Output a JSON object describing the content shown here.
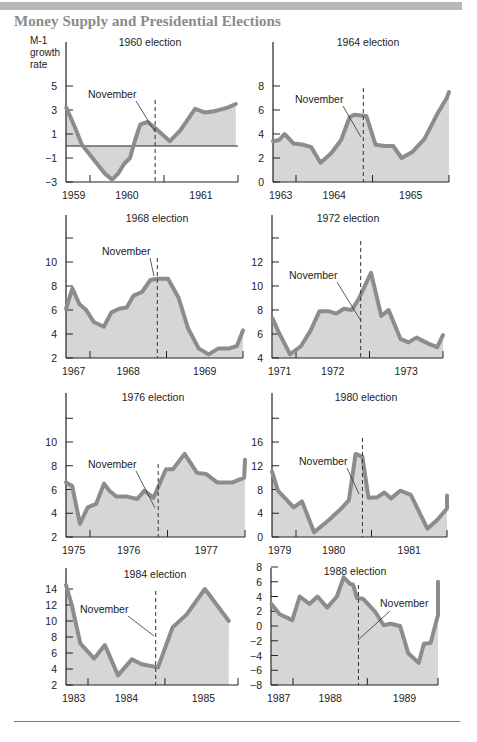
{
  "title": "Money Supply and Presidential Elections",
  "y_axis_label": [
    "M-1",
    "growth",
    "rate"
  ],
  "marker_label": "November",
  "colors": {
    "line": "#8c8c8c",
    "fill": "#d6d6d6",
    "axis": "#222222",
    "title": "#8a8a8a",
    "band": "#b9b9b9"
  },
  "chart_data": [
    {
      "type": "area",
      "title": "1960 election",
      "ylabel": "M-1 growth rate",
      "yticks": [
        5,
        3,
        1,
        -1,
        -3
      ],
      "ylim": [
        -3,
        5
      ],
      "zero_line": true,
      "years": [
        "1959",
        "1960",
        "1961"
      ],
      "november": 1960.88,
      "points": [
        [
          1959.68,
          3.2
        ],
        [
          1959.8,
          1.5
        ],
        [
          1959.89,
          0.1
        ],
        [
          1960.07,
          -1.3
        ],
        [
          1960.2,
          -2.3
        ],
        [
          1960.3,
          -2.8
        ],
        [
          1960.38,
          -2.3
        ],
        [
          1960.46,
          -1.5
        ],
        [
          1960.54,
          -1.0
        ],
        [
          1960.61,
          0.5
        ],
        [
          1960.68,
          1.8
        ],
        [
          1960.78,
          2.0
        ],
        [
          1960.88,
          1.5
        ],
        [
          1961.08,
          0.4
        ],
        [
          1961.22,
          1.3
        ],
        [
          1961.42,
          3.1
        ],
        [
          1961.55,
          2.8
        ],
        [
          1961.68,
          2.9
        ],
        [
          1961.86,
          3.2
        ],
        [
          1961.97,
          3.5
        ]
      ]
    },
    {
      "type": "area",
      "title": "1964 election",
      "yticks": [
        8,
        6,
        4,
        2,
        0
      ],
      "ylim": [
        0,
        8
      ],
      "years": [
        "1963",
        "1964",
        "1965"
      ],
      "november": 1964.88,
      "points": [
        [
          1963.68,
          3.4
        ],
        [
          1963.78,
          3.5
        ],
        [
          1963.85,
          4.0
        ],
        [
          1963.97,
          3.2
        ],
        [
          1964.1,
          3.1
        ],
        [
          1964.2,
          2.9
        ],
        [
          1964.32,
          1.6
        ],
        [
          1964.46,
          2.4
        ],
        [
          1964.59,
          3.5
        ],
        [
          1964.7,
          5.4
        ],
        [
          1964.76,
          5.6
        ],
        [
          1964.92,
          5.5
        ],
        [
          1965.04,
          3.1
        ],
        [
          1965.16,
          3.0
        ],
        [
          1965.27,
          3.0
        ],
        [
          1965.38,
          2.0
        ],
        [
          1965.52,
          2.5
        ],
        [
          1965.68,
          3.6
        ],
        [
          1965.84,
          5.6
        ],
        [
          1965.97,
          7.0
        ],
        [
          1966.05,
          7.5
        ]
      ]
    },
    {
      "type": "area",
      "title": "1968 election",
      "yticks": [
        10,
        8,
        6,
        4,
        2
      ],
      "ylim": [
        2,
        14
      ],
      "years": [
        "1967",
        "1968",
        "1969"
      ],
      "november": 1968.88,
      "points": [
        [
          1967.68,
          6.1
        ],
        [
          1967.77,
          7.8
        ],
        [
          1967.86,
          6.5
        ],
        [
          1967.95,
          6.0
        ],
        [
          1968.05,
          5.0
        ],
        [
          1968.18,
          4.6
        ],
        [
          1968.28,
          5.8
        ],
        [
          1968.38,
          6.1
        ],
        [
          1968.48,
          6.2
        ],
        [
          1968.57,
          7.2
        ],
        [
          1968.68,
          7.5
        ],
        [
          1968.79,
          8.5
        ],
        [
          1968.88,
          8.6
        ],
        [
          1969.02,
          8.6
        ],
        [
          1969.16,
          7.0
        ],
        [
          1969.28,
          4.5
        ],
        [
          1969.42,
          2.8
        ],
        [
          1969.55,
          2.3
        ],
        [
          1969.68,
          2.8
        ],
        [
          1969.82,
          2.8
        ],
        [
          1969.92,
          3.0
        ],
        [
          1970.02,
          4.3
        ]
      ]
    },
    {
      "type": "area",
      "title": "1972 election",
      "yticks": [
        12,
        10,
        8,
        6,
        4
      ],
      "ylim": [
        4,
        16
      ],
      "years": [
        "1971",
        "1972",
        "1973"
      ],
      "november": 1972.88,
      "points": [
        [
          1971.68,
          7.3
        ],
        [
          1971.76,
          6.2
        ],
        [
          1971.92,
          4.3
        ],
        [
          1972.07,
          5.0
        ],
        [
          1972.2,
          6.3
        ],
        [
          1972.32,
          7.9
        ],
        [
          1972.44,
          7.9
        ],
        [
          1972.55,
          7.7
        ],
        [
          1972.65,
          8.1
        ],
        [
          1972.76,
          8.0
        ],
        [
          1972.86,
          9.0
        ],
        [
          1973.02,
          11.1
        ],
        [
          1973.16,
          7.5
        ],
        [
          1973.26,
          8.0
        ],
        [
          1973.42,
          5.6
        ],
        [
          1973.53,
          5.3
        ],
        [
          1973.64,
          5.7
        ],
        [
          1973.8,
          5.2
        ],
        [
          1973.92,
          4.9
        ],
        [
          1974.0,
          5.9
        ]
      ]
    },
    {
      "type": "area",
      "title": "1976 election",
      "yticks": [
        10,
        8,
        6,
        4,
        2
      ],
      "ylim": [
        2,
        14
      ],
      "years": [
        "1975",
        "1976",
        "1977"
      ],
      "november": 1976.88,
      "points": [
        [
          1975.68,
          6.6
        ],
        [
          1975.77,
          6.3
        ],
        [
          1975.87,
          3.1
        ],
        [
          1975.97,
          4.5
        ],
        [
          1976.08,
          4.8
        ],
        [
          1976.18,
          6.5
        ],
        [
          1976.25,
          5.9
        ],
        [
          1976.34,
          5.4
        ],
        [
          1976.48,
          5.4
        ],
        [
          1976.61,
          5.2
        ],
        [
          1976.7,
          5.9
        ],
        [
          1976.82,
          5.3
        ],
        [
          1976.98,
          7.7
        ],
        [
          1977.07,
          7.7
        ],
        [
          1977.22,
          9.0
        ],
        [
          1977.38,
          7.4
        ],
        [
          1977.5,
          7.3
        ],
        [
          1977.64,
          6.6
        ],
        [
          1977.84,
          6.6
        ],
        [
          1977.99,
          7.0
        ],
        [
          1978.15,
          8.5
        ]
      ]
    },
    {
      "type": "area",
      "title": "1980 election",
      "yticks": [
        16,
        12,
        8,
        4,
        0
      ],
      "ylim": [
        0,
        24
      ],
      "years": [
        "1979",
        "1980",
        "1981"
      ],
      "november": 1980.88,
      "points": [
        [
          1979.68,
          11.0
        ],
        [
          1979.76,
          7.8
        ],
        [
          1979.97,
          5.0
        ],
        [
          1980.08,
          6.0
        ],
        [
          1980.24,
          0.8
        ],
        [
          1980.44,
          2.9
        ],
        [
          1980.6,
          4.8
        ],
        [
          1980.7,
          6.2
        ],
        [
          1980.79,
          14.0
        ],
        [
          1980.88,
          13.5
        ],
        [
          1980.96,
          6.6
        ],
        [
          1981.08,
          6.7
        ],
        [
          1981.17,
          7.5
        ],
        [
          1981.26,
          6.5
        ],
        [
          1981.38,
          7.8
        ],
        [
          1981.52,
          7.1
        ],
        [
          1981.74,
          1.4
        ],
        [
          1981.88,
          3.0
        ],
        [
          1982.06,
          4.8
        ],
        [
          1982.15,
          7.0
        ]
      ]
    },
    {
      "type": "area",
      "title": "1984 election",
      "yticks": [
        14,
        12,
        10,
        8,
        6,
        4,
        2
      ],
      "ylim": [
        2,
        16
      ],
      "years": [
        "1983",
        "1984",
        "1985"
      ],
      "november": 1984.88,
      "points": [
        [
          1983.71,
          14.5
        ],
        [
          1983.79,
          12.0
        ],
        [
          1983.9,
          7.2
        ],
        [
          1984.08,
          5.3
        ],
        [
          1984.22,
          7.0
        ],
        [
          1984.39,
          3.2
        ],
        [
          1984.57,
          5.2
        ],
        [
          1984.7,
          4.6
        ],
        [
          1984.91,
          4.2
        ],
        [
          1985.1,
          9.2
        ],
        [
          1985.28,
          10.8
        ],
        [
          1985.52,
          14.0
        ],
        [
          1985.83,
          10.0
        ]
      ]
    },
    {
      "type": "area",
      "title": "1988 election",
      "yticks": [
        8,
        6,
        4,
        2,
        0,
        -2,
        -4,
        -6,
        -8
      ],
      "ylim": [
        -8,
        8
      ],
      "years": [
        "1987",
        "1988",
        "1989"
      ],
      "november": 1988.88,
      "points": [
        [
          1987.71,
          3.0
        ],
        [
          1987.82,
          1.6
        ],
        [
          1987.99,
          0.8
        ],
        [
          1988.09,
          4.0
        ],
        [
          1988.22,
          3.0
        ],
        [
          1988.33,
          4.0
        ],
        [
          1988.46,
          2.5
        ],
        [
          1988.59,
          4.0
        ],
        [
          1988.68,
          6.6
        ],
        [
          1988.77,
          5.7
        ],
        [
          1988.81,
          5.6
        ],
        [
          1988.86,
          3.8
        ],
        [
          1988.94,
          3.7
        ],
        [
          1989.1,
          2.0
        ],
        [
          1989.22,
          0.1
        ],
        [
          1989.31,
          0.3
        ],
        [
          1989.44,
          0.0
        ],
        [
          1989.55,
          -3.7
        ],
        [
          1989.69,
          -5.0
        ],
        [
          1989.76,
          -2.4
        ],
        [
          1989.85,
          -2.3
        ],
        [
          1990.05,
          1.5
        ],
        [
          1990.13,
          4.0
        ],
        [
          1990.22,
          6.0
        ]
      ]
    }
  ]
}
